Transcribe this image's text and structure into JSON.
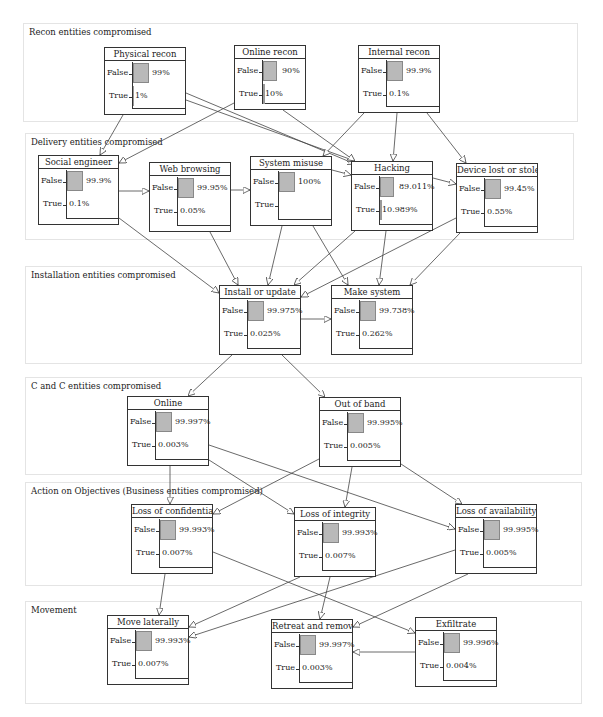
{
  "sections": [
    {
      "id": "recon",
      "label": "Recon entities compromised",
      "x": 23,
      "y": 23,
      "w": 553,
      "h": 97
    },
    {
      "id": "delivery",
      "label": "Delivery entities compromised",
      "x": 25,
      "y": 133,
      "w": 547,
      "h": 105
    },
    {
      "id": "installation",
      "label": "Installation entities compromised",
      "x": 25,
      "y": 266,
      "w": 555,
      "h": 96
    },
    {
      "id": "cc",
      "label": "C and C entities compromised",
      "x": 25,
      "y": 377,
      "w": 555,
      "h": 96
    },
    {
      "id": "action",
      "label": "Action on Objectives (Business entities compromised)",
      "x": 25,
      "y": 482,
      "w": 555,
      "h": 102
    },
    {
      "id": "movement",
      "label": "Movement",
      "x": 25,
      "y": 601,
      "w": 555,
      "h": 101
    }
  ],
  "nodes": [
    {
      "id": "physical-recon",
      "title": "Physical recon",
      "x": 104,
      "y": 47,
      "w": 82,
      "h": 68,
      "false_label": "False",
      "true_label": "True",
      "false_pct": "99%",
      "true_pct": "1%",
      "false_val": 99
    },
    {
      "id": "online-recon",
      "title": "Online recon",
      "x": 234,
      "y": 45,
      "w": 72,
      "h": 65,
      "false_label": "False",
      "true_label": "True",
      "false_pct": "90%",
      "true_pct": "10%",
      "false_val": 90
    },
    {
      "id": "internal-recon",
      "title": "Internal recon",
      "x": 358,
      "y": 45,
      "w": 82,
      "h": 68,
      "false_label": "False",
      "true_label": "True",
      "false_pct": "99.9%",
      "true_pct": "0.1%",
      "false_val": 99.9
    },
    {
      "id": "social-engineer",
      "title": "Social engineer",
      "x": 38,
      "y": 155,
      "w": 81,
      "h": 70,
      "false_label": "False",
      "true_label": "True",
      "false_pct": "99.9%",
      "true_pct": "0.1%",
      "false_val": 99.9
    },
    {
      "id": "web-browsing",
      "title": "Web browsing",
      "x": 149,
      "y": 162,
      "w": 82,
      "h": 70,
      "false_label": "False",
      "true_label": "True",
      "false_pct": "99.95%",
      "true_pct": "0.05%",
      "false_val": 99.95
    },
    {
      "id": "system-misuse",
      "title": "System misuse",
      "x": 250,
      "y": 156,
      "w": 82,
      "h": 70,
      "false_label": "False",
      "true_label": "True",
      "false_pct": "100%",
      "true_pct": "",
      "false_val": 100
    },
    {
      "id": "hacking",
      "title": "Hacking",
      "x": 351,
      "y": 161,
      "w": 82,
      "h": 70,
      "false_label": "False",
      "true_label": "True",
      "false_pct": "89.011%",
      "true_pct": "10.989%",
      "false_val": 89.011
    },
    {
      "id": "device-lost",
      "title": "Device lost or stolen",
      "x": 456,
      "y": 163,
      "w": 82,
      "h": 70,
      "false_label": "False",
      "true_label": "True",
      "false_pct": "99.45%",
      "true_pct": "0.55%",
      "false_val": 99.45
    },
    {
      "id": "install-update",
      "title": "Install or update",
      "x": 219,
      "y": 285,
      "w": 82,
      "h": 70,
      "false_label": "False",
      "true_label": "True",
      "false_pct": "99.975%",
      "true_pct": "0.025%",
      "false_val": 99.975
    },
    {
      "id": "make-system",
      "title": "Make system",
      "x": 331,
      "y": 285,
      "w": 82,
      "h": 70,
      "false_label": "False",
      "true_label": "True",
      "false_pct": "99.738%",
      "true_pct": "0.262%",
      "false_val": 99.738
    },
    {
      "id": "online",
      "title": "Online",
      "x": 127,
      "y": 396,
      "w": 82,
      "h": 70,
      "false_label": "False",
      "true_label": "True",
      "false_pct": "99.997%",
      "true_pct": "0.003%",
      "false_val": 99.997
    },
    {
      "id": "out-of-band",
      "title": "Out of band",
      "x": 319,
      "y": 397,
      "w": 82,
      "h": 70,
      "false_label": "False",
      "true_label": "True",
      "false_pct": "99.995%",
      "true_pct": "0.005%",
      "false_val": 99.995
    },
    {
      "id": "loss-confidentiality",
      "title": "Loss of confidentiality",
      "x": 131,
      "y": 504,
      "w": 82,
      "h": 70,
      "false_label": "False",
      "true_label": "True",
      "false_pct": "99.993%",
      "true_pct": "0.007%",
      "false_val": 99.993
    },
    {
      "id": "loss-integrity",
      "title": "Loss of integrity",
      "x": 294,
      "y": 507,
      "w": 82,
      "h": 70,
      "false_label": "False",
      "true_label": "True",
      "false_pct": "99.993%",
      "true_pct": "0.007%",
      "false_val": 99.993
    },
    {
      "id": "loss-availability",
      "title": "Loss of availability",
      "x": 455,
      "y": 504,
      "w": 82,
      "h": 70,
      "false_label": "False",
      "true_label": "True",
      "false_pct": "99.995%",
      "true_pct": "0.005%",
      "false_val": 99.995
    },
    {
      "id": "move-laterally",
      "title": "Move laterally",
      "x": 107,
      "y": 615,
      "w": 82,
      "h": 70,
      "false_label": "False",
      "true_label": "True",
      "false_pct": "99.993%",
      "true_pct": "0.007%",
      "false_val": 99.993
    },
    {
      "id": "retreat-removal",
      "title": "Retreat and removal",
      "x": 271,
      "y": 619,
      "w": 82,
      "h": 70,
      "false_label": "False",
      "true_label": "True",
      "false_pct": "99.997%",
      "true_pct": "0.003%",
      "false_val": 99.997
    },
    {
      "id": "exfiltrate",
      "title": "Exfiltrate",
      "x": 415,
      "y": 617,
      "w": 82,
      "h": 70,
      "false_label": "False",
      "true_label": "True",
      "false_pct": "99.996%",
      "true_pct": "0.004%",
      "false_val": 99.996
    }
  ],
  "edges": [
    {
      "from": "physical-recon",
      "to": "social-engineer",
      "x1": 123,
      "y1": 115,
      "x2": 100,
      "y2": 155
    },
    {
      "from": "physical-recon",
      "to": "hacking",
      "x1": 186,
      "y1": 93,
      "x2": 355,
      "y2": 164
    },
    {
      "from": "physical-recon",
      "to": "system-misuse",
      "x1": 186,
      "y1": 100,
      "x2": 355,
      "y2": 161
    },
    {
      "from": "online-recon",
      "to": "social-engineer",
      "x1": 234,
      "y1": 103,
      "x2": 119,
      "y2": 163
    },
    {
      "from": "online-recon",
      "to": "hacking",
      "x1": 283,
      "y1": 110,
      "x2": 355,
      "y2": 161
    },
    {
      "from": "internal-recon",
      "to": "system-misuse",
      "x1": 364,
      "y1": 113,
      "x2": 323,
      "y2": 156
    },
    {
      "from": "internal-recon",
      "to": "hacking",
      "x1": 397,
      "y1": 113,
      "x2": 393,
      "y2": 161
    },
    {
      "from": "internal-recon",
      "to": "device-lost",
      "x1": 427,
      "y1": 113,
      "x2": 466,
      "y2": 163
    },
    {
      "from": "social-engineer",
      "to": "web-browsing",
      "x1": 119,
      "y1": 191,
      "x2": 149,
      "y2": 191
    },
    {
      "from": "web-browsing",
      "to": "system-misuse",
      "x1": 231,
      "y1": 190,
      "x2": 250,
      "y2": 190
    },
    {
      "from": "system-misuse",
      "to": "hacking",
      "x1": 332,
      "y1": 170,
      "x2": 351,
      "y2": 175
    },
    {
      "from": "hacking",
      "to": "device-lost",
      "x1": 433,
      "y1": 178,
      "x2": 456,
      "y2": 184
    },
    {
      "from": "social-engineer",
      "to": "install-update",
      "x1": 119,
      "y1": 218,
      "x2": 219,
      "y2": 293
    },
    {
      "from": "web-browsing",
      "to": "install-update",
      "x1": 210,
      "y1": 232,
      "x2": 238,
      "y2": 285
    },
    {
      "from": "system-misuse",
      "to": "install-update",
      "x1": 282,
      "y1": 226,
      "x2": 268,
      "y2": 285
    },
    {
      "from": "system-misuse",
      "to": "make-system",
      "x1": 313,
      "y1": 226,
      "x2": 348,
      "y2": 285
    },
    {
      "from": "hacking",
      "to": "install-update",
      "x1": 355,
      "y1": 231,
      "x2": 294,
      "y2": 285
    },
    {
      "from": "hacking",
      "to": "make-system",
      "x1": 386,
      "y1": 231,
      "x2": 379,
      "y2": 285
    },
    {
      "from": "device-lost",
      "to": "install-update",
      "x1": 456,
      "y1": 218,
      "x2": 301,
      "y2": 297
    },
    {
      "from": "device-lost",
      "to": "make-system",
      "x1": 460,
      "y1": 233,
      "x2": 410,
      "y2": 285
    },
    {
      "from": "install-update",
      "to": "make-system",
      "x1": 301,
      "y1": 319,
      "x2": 331,
      "y2": 319
    },
    {
      "from": "install-update",
      "to": "online",
      "x1": 232,
      "y1": 355,
      "x2": 188,
      "y2": 396
    },
    {
      "from": "install-update",
      "to": "out-of-band",
      "x1": 282,
      "y1": 355,
      "x2": 325,
      "y2": 397
    },
    {
      "from": "online",
      "to": "loss-confidentiality",
      "x1": 170,
      "y1": 466,
      "x2": 170,
      "y2": 504
    },
    {
      "from": "online",
      "to": "loss-integrity",
      "x1": 209,
      "y1": 460,
      "x2": 294,
      "y2": 514
    },
    {
      "from": "online",
      "to": "loss-availability",
      "x1": 209,
      "y1": 445,
      "x2": 455,
      "y2": 529
    },
    {
      "from": "out-of-band",
      "to": "loss-confidentiality",
      "x1": 319,
      "y1": 459,
      "x2": 213,
      "y2": 514
    },
    {
      "from": "out-of-band",
      "to": "loss-integrity",
      "x1": 352,
      "y1": 467,
      "x2": 345,
      "y2": 507
    },
    {
      "from": "out-of-band",
      "to": "loss-availability",
      "x1": 401,
      "y1": 464,
      "x2": 462,
      "y2": 504
    },
    {
      "from": "loss-confidentiality",
      "to": "move-laterally",
      "x1": 165,
      "y1": 574,
      "x2": 159,
      "y2": 615
    },
    {
      "from": "loss-confidentiality",
      "to": "exfiltrate",
      "x1": 213,
      "y1": 552,
      "x2": 415,
      "y2": 633
    },
    {
      "from": "loss-integrity",
      "to": "move-laterally",
      "x1": 300,
      "y1": 577,
      "x2": 189,
      "y2": 627
    },
    {
      "from": "loss-integrity",
      "to": "retreat-removal",
      "x1": 330,
      "y1": 577,
      "x2": 320,
      "y2": 619
    },
    {
      "from": "loss-availability",
      "to": "move-laterally",
      "x1": 455,
      "y1": 550,
      "x2": 189,
      "y2": 637
    },
    {
      "from": "loss-availability",
      "to": "retreat-removal",
      "x1": 468,
      "y1": 574,
      "x2": 353,
      "y2": 627
    },
    {
      "from": "exfiltrate",
      "to": "retreat-removal",
      "x1": 415,
      "y1": 652,
      "x2": 353,
      "y2": 652
    }
  ]
}
